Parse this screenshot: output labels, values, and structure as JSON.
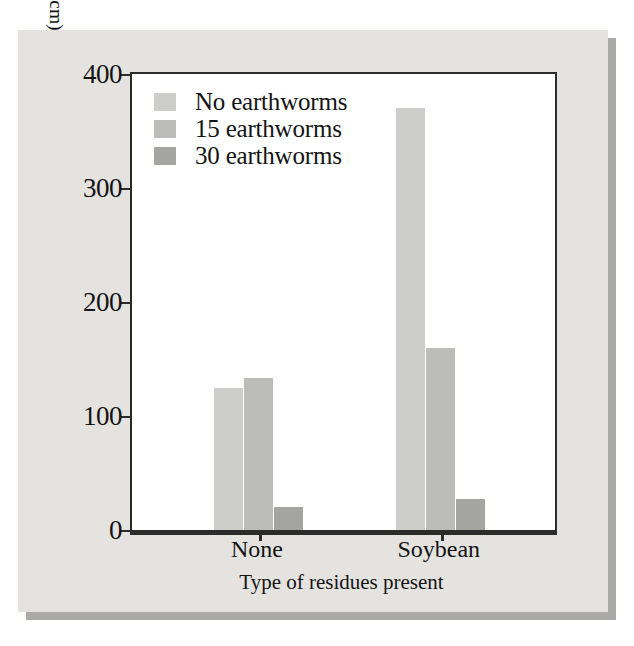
{
  "chart_data": {
    "type": "bar",
    "title": "",
    "xlabel": "Type of residues present",
    "ylabel": "Cumulative infiltration of water in 3 hours (cm)",
    "categories": [
      "None",
      "Soybean"
    ],
    "series": [
      {
        "name": "No earthworms",
        "values": [
          125,
          370
        ],
        "shade": "lightest",
        "color": "#cdcdcb"
      },
      {
        "name": "15 earthworms",
        "values": [
          133,
          160
        ],
        "shade": "medium",
        "color": "#bcbcba"
      },
      {
        "name": "30 earthworms",
        "values": [
          20,
          27
        ],
        "shade": "darkest",
        "color": "#a4a4a2"
      }
    ],
    "ylim": [
      0,
      400
    ],
    "yticks": [
      0,
      100,
      200,
      300,
      400
    ],
    "ytick_labels": [
      "0",
      "100",
      "200",
      "300",
      "400"
    ],
    "grid": false,
    "legend_position": "top-left-inside"
  },
  "legend": {
    "items": [
      {
        "label": "No earthworms",
        "shade": "lightest"
      },
      {
        "label": "15 earthworms",
        "shade": "medium"
      },
      {
        "label": "30 earthworms",
        "shade": "darkest"
      }
    ]
  },
  "axes": {
    "y_title": "Cumulative infiltration of water in 3 hours (cm)",
    "x_title": "Type of residues present",
    "y_tick_labels": [
      "400",
      "300",
      "200",
      "100",
      "0"
    ],
    "x_group_labels": [
      "None",
      "Soybean"
    ]
  },
  "colors": {
    "panel_background": "#e4e3e0",
    "panel_shadow": "#a9a9a7",
    "plot_background": "#ffffff",
    "axis": "#2b2b2b",
    "text": "#141414"
  }
}
